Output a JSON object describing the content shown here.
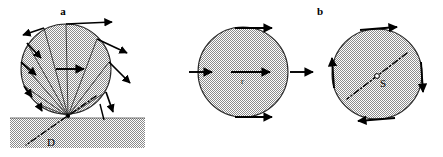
{
  "figure": {
    "type": "scientific-diagram",
    "background_color": "#ffffff",
    "ink_color": "#000000",
    "fill_pattern_color": "#9a9a9a",
    "width": 443,
    "height": 157
  },
  "panels": [
    {
      "id": "panel-a",
      "label": "a",
      "label_x": 63,
      "label_y": 14,
      "circle": {
        "cx": 66,
        "cy": 69,
        "r": 45
      },
      "contact_point": {
        "x": 68,
        "y": 116,
        "label": "D"
      },
      "axis_label": {
        "text": "D",
        "x": 50,
        "y": 143
      },
      "ground": {
        "x": 10,
        "y": 118,
        "width": 135,
        "height": 30
      }
    },
    {
      "id": "panel-b-translation",
      "label": "",
      "circle": {
        "cx": 243,
        "cy": 72,
        "r": 45
      },
      "center_label": {
        "text": "r",
        "x": 244,
        "y": 80
      }
    },
    {
      "id": "panel-b-rotation",
      "label": "b",
      "label_x": 320,
      "label_y": 14,
      "circle": {
        "cx": 377,
        "cy": 74,
        "r": 45
      },
      "axis_label": {
        "text": "S",
        "x": 383,
        "y": 83
      }
    }
  ],
  "labels": {
    "panel_a": "a",
    "panel_b": "b",
    "contact_axis": "D",
    "translation_velocity": "r",
    "rotation_axis": "S"
  },
  "annotations": {
    "panel_a_rays": 9,
    "panel_a_note": "rays from contact point D to rim, each continuing as a velocity arrow",
    "panel_b_translation_arrows": 4,
    "panel_b_rotation_arrows": 4
  }
}
